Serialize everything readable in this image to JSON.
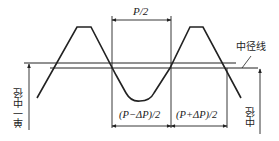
{
  "diagram": {
    "type": "thread profile / single pitch diameter illustration",
    "labels": {
      "half_pitch": "P/2",
      "minus_delta": "(P−ΔP)/2",
      "plus_delta": "(P+ΔP)/2",
      "pitch_line": "中径线",
      "single_pitch_diameter": "单一中径",
      "pitch_diameter": "中径"
    },
    "colors": {
      "line": "#222222",
      "background": "#ffffff"
    }
  }
}
